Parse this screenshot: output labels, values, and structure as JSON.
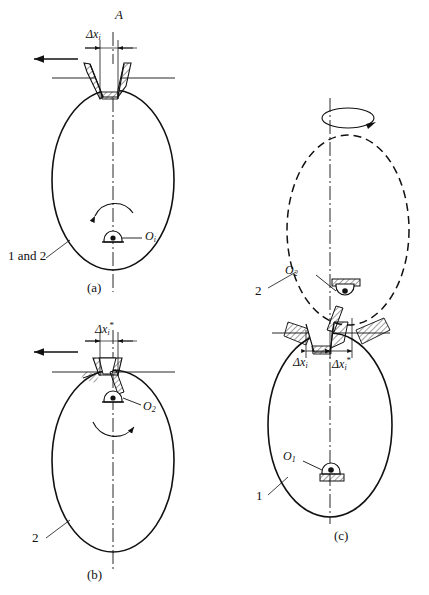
{
  "figure": {
    "title_caption_a": "(a)",
    "title_caption_b": "(b)",
    "title_caption_c": "(c)",
    "background": "#ffffff",
    "line_color": "#111111"
  },
  "panel_a": {
    "axis_label": "A",
    "dimension_label_delta": "Δx",
    "dimension_label_sub": "i",
    "pivot_label_O": "O",
    "pivot_label_sub": "i",
    "body_label": "1 and 2",
    "caption": "(a)",
    "arrow_direction": "left",
    "rotation_arrow": "counter-clockwise"
  },
  "panel_b": {
    "dimension_label_delta": "Δx",
    "dimension_label_sub": "i",
    "dimension_label_star": "*",
    "pivot_label_O": "O",
    "pivot_label_sub": "2",
    "body_label": "2",
    "caption": "(b)",
    "arrow_direction": "left",
    "rotation_arrow": "clockwise"
  },
  "panel_c": {
    "dimension_label_left_delta": "Δx",
    "dimension_label_left_sub": "i",
    "dimension_label_right_delta": "Δx",
    "dimension_label_right_sub": "i",
    "dimension_label_right_star": "*",
    "pivot_upper_O": "O",
    "pivot_upper_sub": "2",
    "pivot_lower_O": "O",
    "pivot_lower_sub": "1",
    "body_label_upper": "2",
    "body_label_lower": "1",
    "caption": "(c)",
    "rotation_symbol": "axial-rotation-ellipse"
  }
}
